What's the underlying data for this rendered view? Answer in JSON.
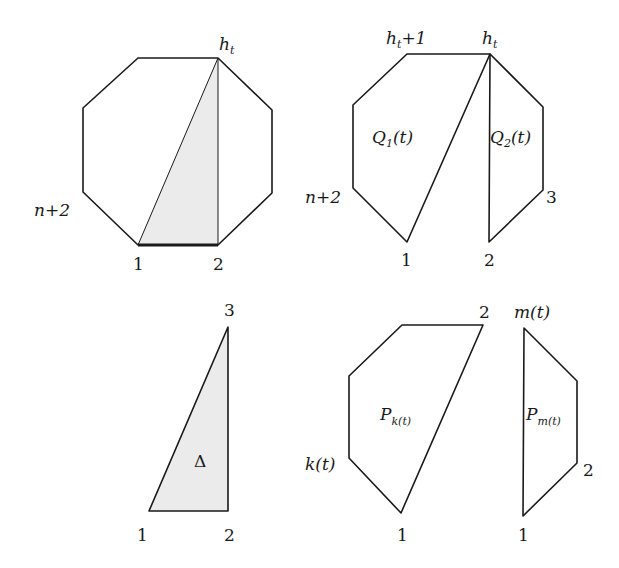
{
  "panels": {
    "octagon": {
      "labels": {
        "top": "h",
        "top_sub": "t",
        "left": "n+2",
        "bottom_left": "1",
        "bottom_right": "2"
      }
    },
    "split": {
      "labels": {
        "top_left": "h",
        "top_left_sub": "t",
        "top_left_suffix": "+1",
        "top_right": "h",
        "top_right_sub": "t",
        "left": "n+2",
        "right": "3",
        "bottom_left": "1",
        "bottom_right": "2"
      },
      "regions": {
        "q1": "Q",
        "q1_sub": "1",
        "q1_arg": "(t)",
        "q2": "Q",
        "q2_sub": "2",
        "q2_arg": "(t)"
      }
    },
    "triangle": {
      "labels": {
        "top": "3",
        "bottom_left": "1",
        "bottom_right": "2",
        "center": "Δ"
      }
    },
    "pk": {
      "labels": {
        "top_right": "2",
        "left": "k(t)",
        "bottom": "1",
        "region": "P",
        "region_sub": "k(t)"
      }
    },
    "pm": {
      "labels": {
        "top": "m(t)",
        "right": "2",
        "bottom": "1",
        "region": "P",
        "region_sub": "m(t)"
      }
    }
  },
  "colors": {
    "stroke": "#1a1a1a",
    "shade": "#ebebeb"
  }
}
